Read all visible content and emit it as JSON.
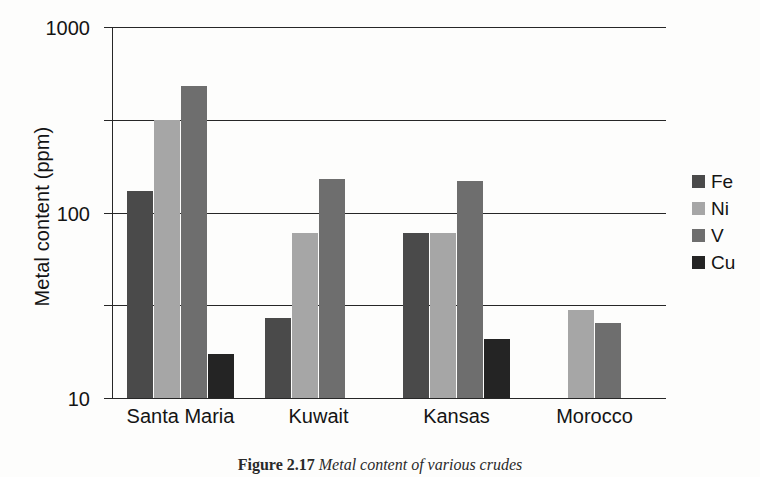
{
  "chart_data": {
    "type": "bar",
    "title": "",
    "xlabel": "",
    "ylabel": "Metal content (ppm)",
    "yscale": "log",
    "ylim": [
      0.1,
      1000
    ],
    "yticks": [
      "0.1",
      "1",
      "10",
      "100",
      "1000"
    ],
    "grid": true,
    "legend_position": "right",
    "categories": [
      "Santa Maria",
      "Kuwait",
      "Kansas",
      "Morocco"
    ],
    "series": [
      {
        "name": "Fe",
        "color": "#4a4a4a",
        "values": [
          17,
          0.72,
          6.0,
          null
        ]
      },
      {
        "name": "Ni",
        "color": "#a6a6a6",
        "values": [
          100,
          6.0,
          6.0,
          0.88
        ]
      },
      {
        "name": "V",
        "color": "#6e6e6e",
        "values": [
          230,
          23,
          22,
          0.65
        ]
      },
      {
        "name": "Cu",
        "color": "#242424",
        "values": [
          0.3,
          null,
          0.43,
          null
        ]
      }
    ]
  },
  "legend": {
    "items": [
      {
        "label": "Fe"
      },
      {
        "label": "Ni"
      },
      {
        "label": "V"
      },
      {
        "label": "Cu"
      }
    ]
  },
  "caption": {
    "prefix": "Figure 2.17",
    "text": "Metal content of various crudes"
  }
}
